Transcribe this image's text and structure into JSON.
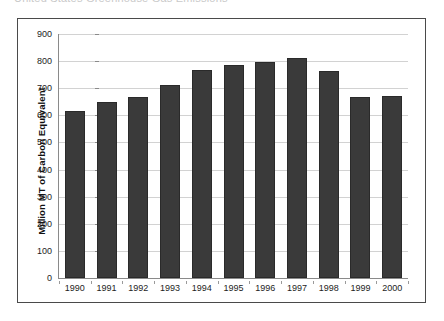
{
  "page": {
    "clipped_text_above": "United States Greenhouse Gas Emissions"
  },
  "chart": {
    "y_axis_title": "Million MT of Carbon Equivalent",
    "bar_color": "#3a3a3a",
    "bar_border_color": "#2a2a2a",
    "gridline_color": "#d2d2d2",
    "axis_color": "#8a8a8a",
    "frame_color": "#4a4a4a"
  },
  "chart_data": {
    "type": "bar",
    "title": "",
    "xlabel": "",
    "ylabel": "Million MT of Carbon Equivalent",
    "categories": [
      "1990",
      "1991",
      "1992",
      "1993",
      "1994",
      "1995",
      "1996",
      "1997",
      "1998",
      "1999",
      "2000"
    ],
    "values": [
      615,
      648,
      667,
      712,
      767,
      785,
      795,
      810,
      765,
      668,
      673
    ],
    "ylim": [
      0,
      900
    ],
    "yticks": [
      0,
      100,
      200,
      300,
      400,
      500,
      600,
      700,
      800,
      900
    ],
    "ytick_labels": [
      "0",
      "100",
      "200",
      "300",
      "400",
      "500",
      "600",
      "700",
      "800",
      "900"
    ],
    "grid": true,
    "legend": false,
    "series": [
      {
        "name": "Million MT of Carbon Equivalent",
        "values": [
          615,
          648,
          667,
          712,
          767,
          785,
          795,
          810,
          765,
          668,
          673
        ]
      }
    ]
  }
}
